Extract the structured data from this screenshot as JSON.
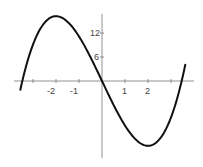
{
  "chart_data": {
    "type": "line",
    "title": "",
    "xlabel": "",
    "ylabel": "",
    "function": "f(x) = x^3 - 12x",
    "x_tick_labels": [
      "-2",
      "-1",
      "1",
      "2"
    ],
    "x_ticks": [
      -3,
      -2,
      -1,
      1,
      2,
      3
    ],
    "y_tick_labels": [
      "12",
      "6"
    ],
    "y_ticks": [
      12,
      6
    ],
    "xlim": [
      -3.6,
      3.7
    ],
    "ylim": [
      -20,
      20
    ],
    "grid": false,
    "series": [
      {
        "name": "f(x)",
        "x": [
          -3.5,
          -3.0,
          -2.5,
          -2.0,
          -1.5,
          -1.0,
          -0.5,
          0,
          0.5,
          1.0,
          1.5,
          2.0,
          2.5,
          3.0,
          3.6
        ],
        "y": [
          -0.875,
          9,
          14.375,
          16,
          14.625,
          11,
          5.875,
          0,
          -5.875,
          -11,
          -14.625,
          -16,
          -14.375,
          -9,
          3.456
        ]
      }
    ],
    "key_points": {
      "local_max": {
        "x": -2,
        "y": 16
      },
      "local_min": {
        "x": 2,
        "y": -16
      },
      "roots": [
        -3.464,
        0,
        3.464
      ]
    },
    "color": "#111111"
  }
}
